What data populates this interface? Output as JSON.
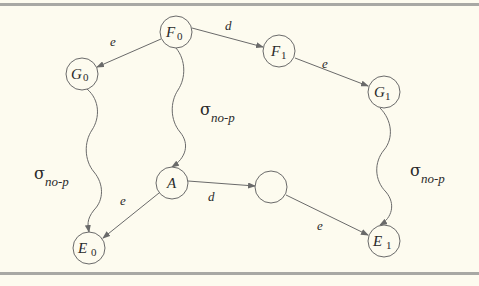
{
  "diagram": {
    "nodes": [
      {
        "id": "F0",
        "label": "F",
        "sub": "0",
        "cx": 176,
        "cy": 32
      },
      {
        "id": "G0",
        "label": "G",
        "sub": "0",
        "cx": 82,
        "cy": 74
      },
      {
        "id": "F1",
        "label": "F",
        "sub": "1",
        "cx": 279,
        "cy": 51
      },
      {
        "id": "G1",
        "label": "G",
        "sub": "1",
        "cx": 384,
        "cy": 92
      },
      {
        "id": "A",
        "label": "A",
        "sub": "",
        "cx": 172,
        "cy": 183
      },
      {
        "id": "empty",
        "label": "",
        "sub": "",
        "cx": 271,
        "cy": 187
      },
      {
        "id": "E0",
        "label": "E",
        "sub": "0",
        "cx": 89,
        "cy": 248
      },
      {
        "id": "E1",
        "label": "E",
        "sub": "1",
        "cx": 384,
        "cy": 241
      }
    ],
    "edges": [
      {
        "from": "F0",
        "to": "G0",
        "label": "e",
        "type": "straight"
      },
      {
        "from": "F0",
        "to": "F1",
        "label": "d",
        "type": "straight"
      },
      {
        "from": "F1",
        "to": "G1",
        "label": "e",
        "type": "straight"
      },
      {
        "from": "A",
        "to": "E0",
        "label": "e",
        "type": "straight"
      },
      {
        "from": "A",
        "to": "empty",
        "label": "d",
        "type": "straight"
      },
      {
        "from": "empty",
        "to": "E1",
        "label": "e",
        "type": "straight"
      },
      {
        "from": "G0",
        "to": "E0",
        "label": "σ no-p",
        "type": "wavy"
      },
      {
        "from": "F0",
        "to": "A",
        "label": "σ no-p",
        "type": "wavy"
      },
      {
        "from": "G1",
        "to": "E1",
        "label": "σ no-p",
        "type": "wavy"
      }
    ],
    "labels": {
      "e_F0_G0": "e",
      "d_F0_F1": "d",
      "e_F1_G1": "e",
      "e_A_E0": "e",
      "d_A_empty": "d",
      "e_empty_E1": "e",
      "sigma": "σ",
      "sigma_sub": "no-p"
    },
    "colors": {
      "background": "#fdfbef",
      "rule": "#a8a8a4",
      "stroke": "#6a6a6a",
      "text": "#2a2a2a"
    }
  }
}
